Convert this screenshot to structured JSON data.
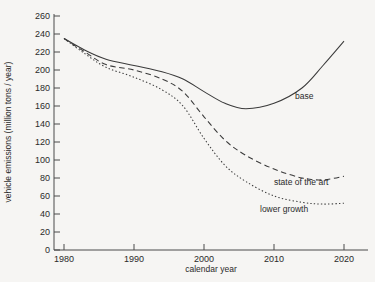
{
  "chart_data": {
    "type": "line",
    "title": "",
    "xlabel": "calendar year",
    "ylabel": "vehicle emissions (million tons / year)",
    "xlim": [
      1978,
      2022
    ],
    "ylim": [
      0,
      265
    ],
    "xticks": [
      1980,
      1990,
      2000,
      2010,
      2020
    ],
    "xtick_labels": [
      "1980",
      "1990",
      "2000",
      "2010",
      "2020"
    ],
    "yticks": [
      0,
      20,
      40,
      60,
      80,
      100,
      120,
      140,
      160,
      180,
      200,
      220,
      240,
      260
    ],
    "ytick_labels": [
      "0",
      "20",
      "40",
      "60",
      "80",
      "100",
      "120",
      "140",
      "160",
      "180",
      "200",
      "220",
      "240",
      "260"
    ],
    "grid": false,
    "legend_position": "inline-right-of-curves",
    "series": [
      {
        "name": "base",
        "style": "solid",
        "label": "base",
        "label_x": 2013,
        "label_y": 168,
        "x": [
          1980,
          1983,
          1986,
          1990,
          1994,
          1997,
          2000,
          2003,
          2006,
          2010,
          2014,
          2017,
          2020
        ],
        "y": [
          235,
          222,
          212,
          205,
          198,
          190,
          176,
          163,
          157,
          163,
          180,
          205,
          232
        ]
      },
      {
        "name": "state of the art",
        "style": "dashed",
        "label": "state of the art",
        "label_x": 2010,
        "label_y": 72,
        "x": [
          1980,
          1983,
          1986,
          1990,
          1994,
          1997,
          2000,
          2003,
          2006,
          2010,
          2014,
          2017,
          2020
        ],
        "y": [
          235,
          220,
          206,
          200,
          190,
          176,
          148,
          122,
          105,
          90,
          80,
          78,
          82
        ]
      },
      {
        "name": "lower growth",
        "style": "dotted",
        "label": "lower growth",
        "label_x": 2008,
        "label_y": 42,
        "x": [
          1980,
          1983,
          1986,
          1990,
          1994,
          1997,
          2000,
          2003,
          2006,
          2010,
          2014,
          2017,
          2020
        ],
        "y": [
          235,
          218,
          203,
          192,
          178,
          160,
          124,
          94,
          76,
          60,
          53,
          51,
          52
        ]
      }
    ]
  }
}
